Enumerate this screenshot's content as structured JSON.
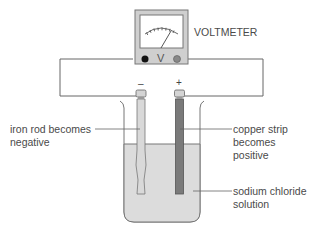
{
  "voltmeter": {
    "label": "VOLTMETER",
    "symbol": "V",
    "terminal_negative_color": "#111111",
    "terminal_positive_color": "#888888"
  },
  "electrodes": {
    "negative_sign": "–",
    "positive_sign": "+",
    "iron_color": "#d9d9d9",
    "copper_color": "#7a7a7a"
  },
  "labels": {
    "iron_line1": "iron rod becomes",
    "iron_line2": "negative",
    "copper_line1": "copper strip",
    "copper_line2": "becomes",
    "copper_line3": "positive",
    "solution_line1": "sodium chloride",
    "solution_line2": "solution"
  },
  "colors": {
    "wire": "#666666",
    "solution": "#dcdcdc",
    "beaker_outline": "#7a7a7a",
    "voltmeter_body": "#cfcfcf"
  }
}
